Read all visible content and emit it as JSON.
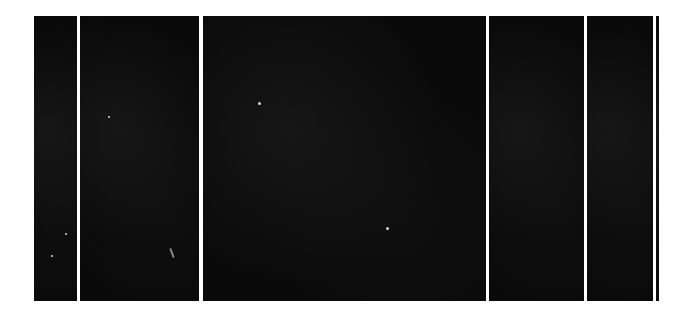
{
  "image": {
    "description": "Row of black panels separated by thin white vertical gaps",
    "background_color": "#ffffff",
    "panel_color": "#0a0a0a",
    "panels": [
      {
        "left": 34,
        "top": 16,
        "width": 43,
        "height": 285
      },
      {
        "left": 80,
        "top": 16,
        "width": 119,
        "height": 285
      },
      {
        "left": 203,
        "top": 16,
        "width": 283,
        "height": 285
      },
      {
        "left": 489,
        "top": 16,
        "width": 95,
        "height": 285
      },
      {
        "left": 587,
        "top": 16,
        "width": 66,
        "height": 285
      },
      {
        "left": 656,
        "top": 16,
        "width": 3,
        "height": 285
      }
    ],
    "specks": [
      {
        "left": 258,
        "top": 102,
        "size": 3
      },
      {
        "left": 386,
        "top": 227,
        "size": 3
      },
      {
        "left": 108,
        "top": 116,
        "size": 2
      },
      {
        "left": 65,
        "top": 233,
        "size": 2
      },
      {
        "left": 51,
        "top": 255,
        "size": 2
      }
    ],
    "streaks": [
      {
        "left": 171,
        "top": 248
      }
    ]
  }
}
